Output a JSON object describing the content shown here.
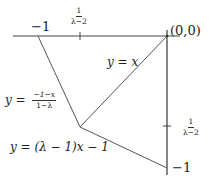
{
  "diagram": {
    "axes": {
      "horizontal": {
        "x1": 13,
        "y": 36,
        "x2": 180
      },
      "vertical": {
        "x": 167,
        "y1": 30,
        "y2": 175
      },
      "color": "#555555"
    },
    "origin_label": "(0,0)",
    "horizontal_axis_labels": {
      "minus_one": "−1",
      "tick_frac_num": "1",
      "tick_frac_den": "λ−2"
    },
    "vertical_axis_labels": {
      "minus_one": "−1",
      "tick_frac_num": "1",
      "tick_frac_den": "λ−2"
    },
    "lines": [
      {
        "name": "y=x",
        "from": [
          167,
          36
        ],
        "to": [
          80,
          127
        ]
      },
      {
        "name": "y=(-1-x)/(1-λ)",
        "from": [
          38,
          36
        ],
        "to": [
          80,
          127
        ]
      },
      {
        "name": "y=(λ-1)x-1",
        "from": [
          80,
          127
        ],
        "to": [
          167,
          168
        ]
      }
    ],
    "line_labels": {
      "y_eq_x_lhs": "y",
      "y_eq_x_eq": " = ",
      "y_eq_x_rhs": "x",
      "frac_line_lhs": "y = ",
      "frac_line_num": "−1−x",
      "frac_line_den": "1−λ",
      "linear_line": "y = (λ − 1)x − 1"
    },
    "line_color": "#555555"
  }
}
